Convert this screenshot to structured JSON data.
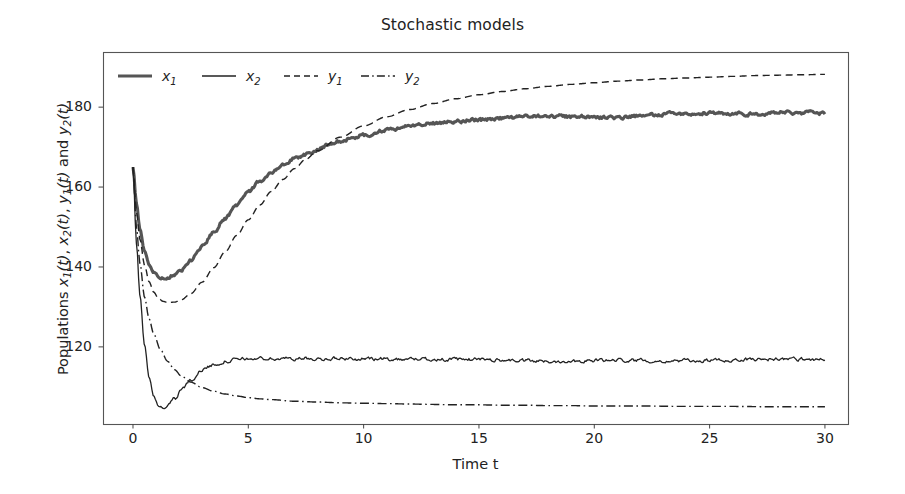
{
  "chart_data": {
    "type": "line",
    "title": "Stochastic models",
    "xlabel": "Time t",
    "ylabel_plain": "Populations x1(t), x2(t), y1(t) and y2(t)",
    "ylabel_prefix": "Populations ",
    "ylabel_parts": [
      "x",
      "1",
      "(t), ",
      "x",
      "2",
      "(t), ",
      "y",
      "1",
      "(t) and ",
      "y",
      "2",
      "(t)"
    ],
    "xlim": [
      -1.3,
      31.0
    ],
    "ylim": [
      100.7,
      193.8
    ],
    "xticks": [
      0,
      5,
      10,
      15,
      20,
      25,
      30
    ],
    "xticklabels": [
      "0",
      "5",
      "10",
      "15",
      "20",
      "25",
      "30"
    ],
    "yticks": [
      120,
      140,
      160,
      180
    ],
    "yticklabels": [
      "120",
      "140",
      "160",
      "180"
    ],
    "grid": false,
    "legend_position": "upper left",
    "legend_entries": [
      {
        "base": "x",
        "sub": "1",
        "style": "solid-thick",
        "color": "#555555"
      },
      {
        "base": "x",
        "sub": "2",
        "style": "solid",
        "color": "#222222"
      },
      {
        "base": "y",
        "sub": "1",
        "style": "dashed",
        "color": "#222222"
      },
      {
        "base": "y",
        "sub": "2",
        "style": "dashdot",
        "color": "#222222"
      }
    ],
    "series": [
      {
        "name": "x1",
        "label_base": "x",
        "label_sub": "1",
        "color": "#555555",
        "linestyle": "solid",
        "linewidth": 3.1,
        "noisy": true,
        "x": [
          0.0,
          0.15,
          0.3,
          0.5,
          0.7,
          0.9,
          1.1,
          1.3,
          1.5,
          1.8,
          2.1,
          2.5,
          3.0,
          3.5,
          4.0,
          4.5,
          5.0,
          5.5,
          6.0,
          6.5,
          7.0,
          7.5,
          8.0,
          8.5,
          9.0,
          9.5,
          10.0,
          11.0,
          12.0,
          13.0,
          14.0,
          15.0,
          16.0,
          17.0,
          18.0,
          19.0,
          20.0,
          21.0,
          22.0,
          23.0,
          24.0,
          25.0,
          26.0,
          27.0,
          28.0,
          29.0,
          30.0
        ],
        "y": [
          165.0,
          156.0,
          149.5,
          144.0,
          140.6,
          138.6,
          137.6,
          137.3,
          137.4,
          138.1,
          139.4,
          141.6,
          145.0,
          148.6,
          152.2,
          155.6,
          158.8,
          161.5,
          163.8,
          165.7,
          167.2,
          168.3,
          169.3,
          170.6,
          171.4,
          172.3,
          172.9,
          174.2,
          175.3,
          175.9,
          176.4,
          176.9,
          177.2,
          177.6,
          177.8,
          177.6,
          177.5,
          177.4,
          177.8,
          178.2,
          178.5,
          178.5,
          178.4,
          178.2,
          178.6,
          178.6,
          178.4
        ]
      },
      {
        "name": "x2",
        "label_base": "x",
        "label_sub": "2",
        "color": "#222222",
        "linestyle": "solid",
        "linewidth": 1.3,
        "noisy": true,
        "x": [
          0.0,
          0.15,
          0.3,
          0.5,
          0.7,
          0.9,
          1.1,
          1.3,
          1.5,
          1.8,
          2.1,
          2.5,
          3.0,
          3.5,
          4.0,
          4.5,
          5.0,
          5.5,
          6.0,
          7.0,
          8.0,
          9.0,
          10.0,
          11.0,
          12.0,
          13.0,
          14.0,
          15.0,
          16.0,
          17.0,
          18.0,
          19.0,
          20.0,
          21.0,
          22.0,
          23.0,
          24.0,
          25.0,
          26.0,
          27.0,
          28.0,
          29.0,
          30.0
        ],
        "y": [
          165.0,
          146.0,
          133.0,
          120.5,
          112.5,
          107.6,
          105.4,
          104.9,
          105.3,
          107.0,
          109.2,
          111.8,
          114.2,
          115.6,
          116.4,
          116.8,
          117.0,
          117.1,
          117.0,
          117.1,
          117.0,
          117.1,
          117.0,
          116.9,
          117.0,
          116.9,
          116.8,
          116.9,
          116.7,
          116.5,
          116.3,
          116.5,
          116.6,
          116.7,
          116.6,
          116.5,
          116.5,
          116.6,
          116.7,
          116.9,
          117.0,
          116.9,
          116.9
        ]
      },
      {
        "name": "y1",
        "label_base": "y",
        "label_sub": "1",
        "color": "#222222",
        "linestyle": "dashed",
        "linewidth": 1.4,
        "noisy": false,
        "x": [
          0.0,
          0.15,
          0.3,
          0.5,
          0.7,
          0.9,
          1.1,
          1.3,
          1.5,
          1.8,
          2.1,
          2.5,
          3.0,
          3.5,
          4.0,
          4.5,
          5.0,
          5.5,
          6.0,
          6.5,
          7.0,
          7.5,
          8.0,
          9.0,
          10.0,
          11.0,
          12.0,
          13.0,
          14.0,
          15.0,
          16.0,
          17.0,
          18.0,
          19.0,
          20.0,
          21.0,
          22.0,
          23.0,
          24.0,
          25.0,
          26.0,
          27.0,
          28.0,
          29.0,
          30.0
        ],
        "y": [
          165.0,
          154.0,
          147.0,
          140.5,
          136.3,
          133.7,
          132.2,
          131.4,
          131.1,
          131.2,
          131.8,
          133.3,
          136.2,
          139.8,
          143.8,
          147.9,
          151.8,
          155.5,
          158.9,
          161.9,
          164.6,
          167.0,
          169.1,
          172.5,
          175.3,
          177.6,
          179.4,
          180.9,
          182.1,
          183.1,
          183.9,
          184.6,
          185.2,
          185.7,
          186.1,
          186.5,
          186.8,
          187.1,
          187.3,
          187.5,
          187.7,
          187.9,
          188.0,
          188.1,
          188.2
        ]
      },
      {
        "name": "y2",
        "label_base": "y",
        "label_sub": "2",
        "color": "#222222",
        "linestyle": "dashdot",
        "linewidth": 1.4,
        "noisy": false,
        "x": [
          0.0,
          0.15,
          0.3,
          0.5,
          0.7,
          0.9,
          1.2,
          1.5,
          1.8,
          2.1,
          2.5,
          3.0,
          3.5,
          4.0,
          4.5,
          5.0,
          5.5,
          6.0,
          7.0,
          8.0,
          9.0,
          10.0,
          11.0,
          12.0,
          13.0,
          14.0,
          15.0,
          16.0,
          17.0,
          18.0,
          19.0,
          20.0,
          22.0,
          24.0,
          26.0,
          28.0,
          30.0
        ],
        "y": [
          165.0,
          150.0,
          141.0,
          132.5,
          127.0,
          123.2,
          119.2,
          116.4,
          114.3,
          112.7,
          111.2,
          109.8,
          108.9,
          108.2,
          107.7,
          107.3,
          107.0,
          106.8,
          106.4,
          106.2,
          106.0,
          105.9,
          105.8,
          105.7,
          105.6,
          105.5,
          105.5,
          105.4,
          105.4,
          105.3,
          105.3,
          105.2,
          105.2,
          105.1,
          105.1,
          105.0,
          105.0
        ]
      }
    ]
  },
  "figure": {
    "background": "#ffffff",
    "frame_color": "#555555",
    "tick_color": "#444444"
  }
}
